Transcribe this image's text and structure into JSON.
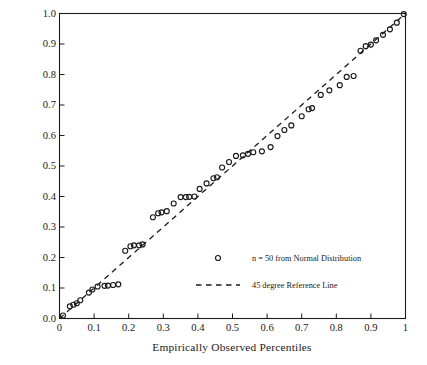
{
  "chart_data": {
    "type": "scatter",
    "title": "",
    "xlabel": "Empirically Observed Percentiles",
    "ylabel": "Fitted Percentiles Based Upon a Normal Distribution",
    "xlim": [
      0,
      1
    ],
    "ylim": [
      0,
      1
    ],
    "grid": false,
    "xticks": [
      0,
      0.1,
      0.2,
      0.3,
      0.4,
      0.5,
      0.6,
      0.7,
      0.8,
      0.9,
      1
    ],
    "xticklabels": [
      "0",
      "0.1",
      "0.2",
      "0.3",
      "0.4",
      "0.5",
      "0.6",
      "0.7",
      "0.8",
      "0.9",
      "1"
    ],
    "yticks": [
      0,
      0.1,
      0.2,
      0.3,
      0.4,
      0.5,
      0.6,
      0.7,
      0.8,
      0.9,
      1
    ],
    "yticklabels": [
      "0.0",
      "0.1",
      "0.2",
      "0.3",
      "0.4",
      "0.5",
      "0.6",
      "0.7",
      "0.8",
      "0.9",
      "1.0"
    ],
    "legend_position": "lower right",
    "series": [
      {
        "name": "n = 50 from Normal Distribution",
        "type": "scatter",
        "marker": "open-circle",
        "color": "#1a1a1a",
        "x": [
          0.01,
          0.03,
          0.04,
          0.05,
          0.06,
          0.085,
          0.095,
          0.11,
          0.13,
          0.14,
          0.155,
          0.17,
          0.19,
          0.205,
          0.215,
          0.23,
          0.24,
          0.27,
          0.285,
          0.295,
          0.31,
          0.33,
          0.35,
          0.365,
          0.375,
          0.39,
          0.405,
          0.425,
          0.445,
          0.455,
          0.47,
          0.49,
          0.51,
          0.53,
          0.545,
          0.56,
          0.585,
          0.61,
          0.63,
          0.65,
          0.67,
          0.7,
          0.72,
          0.73,
          0.755,
          0.78,
          0.81,
          0.83,
          0.85,
          0.87,
          0.885,
          0.9,
          0.915,
          0.935,
          0.955,
          0.975,
          0.995
        ],
        "y": [
          0.01,
          0.04,
          0.045,
          0.05,
          0.06,
          0.085,
          0.095,
          0.105,
          0.107,
          0.108,
          0.11,
          0.112,
          0.222,
          0.237,
          0.24,
          0.24,
          0.243,
          0.332,
          0.345,
          0.348,
          0.352,
          0.377,
          0.398,
          0.398,
          0.399,
          0.4,
          0.425,
          0.443,
          0.46,
          0.463,
          0.495,
          0.513,
          0.533,
          0.535,
          0.54,
          0.545,
          0.548,
          0.562,
          0.598,
          0.618,
          0.633,
          0.663,
          0.686,
          0.69,
          0.733,
          0.748,
          0.765,
          0.792,
          0.795,
          0.878,
          0.893,
          0.898,
          0.912,
          0.93,
          0.948,
          0.97,
          0.998
        ],
        "n": 50
      },
      {
        "name": "45 degree Reference Line",
        "type": "line",
        "style": "dashed",
        "color": "#1a1a1a",
        "x": [
          0,
          1
        ],
        "y": [
          0,
          1
        ]
      }
    ],
    "legend": [
      {
        "label": "n = 50 from Normal Distribution",
        "marker": "open-circle"
      },
      {
        "label": "45 degree Reference Line",
        "marker": "dashed-line"
      }
    ]
  },
  "colors": {
    "axis": "#1a1a1a",
    "marker": "#1a1a1a",
    "reference_line": "#1a1a1a",
    "background": "#ffffff"
  }
}
